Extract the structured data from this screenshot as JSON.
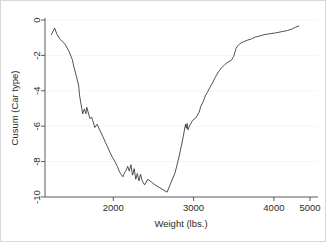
{
  "chart_data": {
    "type": "line",
    "title": "",
    "subtitle": "",
    "xlabel": "Weight (lbs.)",
    "ylabel": "Cusum (Car type)",
    "xlim": [
      1680,
      5080
    ],
    "ylim": [
      -10.6,
      0.35
    ],
    "xticks": [
      2000,
      3000,
      4000,
      5000
    ],
    "xtick_labels": [
      "2000",
      "3000",
      "4000",
      "5000"
    ],
    "yticks": [
      0,
      -2,
      -4,
      -6,
      -8,
      -10
    ],
    "ytick_labels": [
      "0",
      "-2",
      "-4",
      "-6",
      "-8",
      "-10"
    ],
    "grid": true,
    "grid_axis": "y",
    "legend": null,
    "legend_position": "none",
    "line_color": "#333333",
    "background_color": "#ffffff",
    "series": [
      {
        "name": "Cusum (Car type)",
        "x": [
          1760,
          1800,
          1830,
          1870,
          1930,
          1980,
          2020,
          2040,
          2070,
          2100,
          2110,
          2130,
          2150,
          2170,
          2190,
          2200,
          2220,
          2240,
          2260,
          2280,
          2300,
          2330,
          2360,
          2400,
          2430,
          2460,
          2490,
          2520,
          2550,
          2580,
          2600,
          2620,
          2650,
          2670,
          2690,
          2710,
          2730,
          2750,
          2770,
          2790,
          2810,
          2830,
          2850,
          2870,
          2890,
          2920,
          2960,
          3000,
          3050,
          3100,
          3150,
          3200,
          3250,
          3300,
          3350,
          3400,
          3430,
          3440,
          3450,
          3460,
          3480,
          3520,
          3560,
          3600,
          3620,
          3650,
          3680,
          3700,
          3730,
          3760,
          3800,
          3840,
          3880,
          3920,
          3960,
          4000,
          4030,
          4060,
          4080,
          4110,
          4150,
          4200,
          4250,
          4300,
          4340,
          4380,
          4420,
          4480,
          4550,
          4620,
          4700,
          4760,
          4800,
          4840
        ],
        "y": [
          -0.55,
          -0.15,
          -0.55,
          -0.85,
          -1.15,
          -1.6,
          -2.1,
          -2.55,
          -3.1,
          -3.75,
          -4.3,
          -4.9,
          -5.45,
          -5.15,
          -5.45,
          -5.05,
          -5.4,
          -5.75,
          -5.65,
          -5.95,
          -6.3,
          -6.1,
          -6.45,
          -6.85,
          -7.2,
          -7.5,
          -7.85,
          -8.15,
          -8.4,
          -8.7,
          -8.95,
          -9.15,
          -9.35,
          -9.1,
          -8.95,
          -8.7,
          -9.0,
          -8.6,
          -9.25,
          -8.85,
          -9.5,
          -9.15,
          -9.6,
          -9.2,
          -9.6,
          -9.85,
          -9.5,
          -9.65,
          -9.85,
          -10.0,
          -10.15,
          -10.3,
          -9.7,
          -9.1,
          -8.1,
          -6.9,
          -6.1,
          -6.35,
          -6.05,
          -6.45,
          -6.2,
          -5.85,
          -5.7,
          -5.35,
          -5.0,
          -4.7,
          -4.3,
          -4.15,
          -3.85,
          -3.6,
          -3.2,
          -2.85,
          -2.6,
          -2.4,
          -2.25,
          -2.15,
          -1.9,
          -1.4,
          -1.25,
          -1.1,
          -1.0,
          -0.9,
          -0.82,
          -0.7,
          -0.66,
          -0.6,
          -0.55,
          -0.5,
          -0.45,
          -0.38,
          -0.3,
          -0.2,
          -0.1,
          -0.02
        ]
      }
    ]
  },
  "axes": {
    "y_axis_name": "y-axis",
    "x_axis_name": "x-axis"
  }
}
